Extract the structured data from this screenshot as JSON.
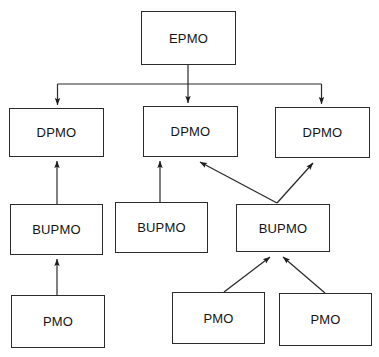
{
  "diagram": {
    "type": "organizational-hierarchy",
    "stroke_color": "#2b2b2b",
    "text_color": "#151515",
    "background_color": "#ffffff",
    "nodes": [
      {
        "id": "epmo",
        "label": "EPMO",
        "level": 1,
        "x": 141,
        "y": 11,
        "w": 95,
        "h": 54
      },
      {
        "id": "dpmo1",
        "label": "DPMO",
        "level": 2,
        "x": 9,
        "y": 108,
        "w": 95,
        "h": 49
      },
      {
        "id": "dpmo2",
        "label": "DPMO",
        "level": 2,
        "x": 143,
        "y": 106,
        "w": 95,
        "h": 51
      },
      {
        "id": "dpmo3",
        "label": "DPMO",
        "level": 2,
        "x": 275,
        "y": 107,
        "w": 95,
        "h": 51
      },
      {
        "id": "bupmo1",
        "label": "BUPMO",
        "level": 3,
        "x": 10,
        "y": 204,
        "w": 93,
        "h": 51
      },
      {
        "id": "bupmo2",
        "label": "BUPMO",
        "level": 3,
        "x": 115,
        "y": 202,
        "w": 93,
        "h": 51
      },
      {
        "id": "bupmo3",
        "label": "BUPMO",
        "level": 3,
        "x": 236,
        "y": 204,
        "w": 94,
        "h": 48
      },
      {
        "id": "pmo1",
        "label": "PMO",
        "level": 4,
        "x": 11,
        "y": 295,
        "w": 94,
        "h": 53
      },
      {
        "id": "pmo2",
        "label": "PMO",
        "level": 4,
        "x": 172,
        "y": 292,
        "w": 93,
        "h": 52
      },
      {
        "id": "pmo3",
        "label": "PMO",
        "level": 4,
        "x": 279,
        "y": 293,
        "w": 93,
        "h": 53
      }
    ],
    "edges": [
      {
        "id": "edge-epmo-dpmo1",
        "from": "epmo",
        "to": "dpmo1",
        "style": "orthogonal-bus",
        "direction": "down"
      },
      {
        "id": "edge-epmo-dpmo2",
        "from": "epmo",
        "to": "dpmo2",
        "style": "straight",
        "direction": "down"
      },
      {
        "id": "edge-epmo-dpmo3",
        "from": "epmo",
        "to": "dpmo3",
        "style": "orthogonal-bus",
        "direction": "down"
      },
      {
        "id": "edge-bupmo1-dpmo1",
        "from": "bupmo1",
        "to": "dpmo1",
        "style": "straight",
        "direction": "up"
      },
      {
        "id": "edge-bupmo2-dpmo2",
        "from": "bupmo2",
        "to": "dpmo2",
        "style": "straight",
        "direction": "up"
      },
      {
        "id": "edge-bupmo3-dpmo2",
        "from": "bupmo3",
        "to": "dpmo2",
        "style": "diagonal",
        "direction": "up"
      },
      {
        "id": "edge-bupmo3-dpmo3",
        "from": "bupmo3",
        "to": "dpmo3",
        "style": "diagonal",
        "direction": "up"
      },
      {
        "id": "edge-pmo1-bupmo1",
        "from": "pmo1",
        "to": "bupmo1",
        "style": "straight",
        "direction": "up"
      },
      {
        "id": "edge-pmo2-bupmo3",
        "from": "pmo2",
        "to": "bupmo3",
        "style": "diagonal",
        "direction": "up"
      },
      {
        "id": "edge-pmo3-bupmo3",
        "from": "pmo3",
        "to": "bupmo3",
        "style": "diagonal",
        "direction": "up"
      }
    ]
  }
}
